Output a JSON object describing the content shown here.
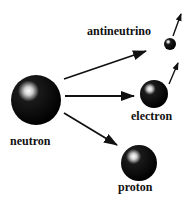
{
  "diagram": {
    "colors": {
      "particle": "#000000",
      "highlight": "#ffffff",
      "arrow": "#111111",
      "text": "#111111",
      "background": "#ffffff"
    },
    "particles": [
      {
        "id": "neutron",
        "label": "neutron",
        "cx": 36,
        "cy": 100,
        "r": 25
      },
      {
        "id": "electron",
        "label": "electron",
        "cx": 154,
        "cy": 94,
        "r": 14
      },
      {
        "id": "proton",
        "label": "proton",
        "cx": 139,
        "cy": 163,
        "r": 18
      },
      {
        "id": "antineutrino",
        "label": "antineutrino",
        "cx": 170,
        "cy": 44,
        "r": 6
      }
    ],
    "arrows": [
      {
        "from": "neutron",
        "to": "antineutrino",
        "x1": 64,
        "y1": 79,
        "x2": 146,
        "y2": 51
      },
      {
        "from": "neutron",
        "to": "electron",
        "x1": 65,
        "y1": 96,
        "x2": 134,
        "y2": 96
      },
      {
        "from": "neutron",
        "to": "proton",
        "x1": 64,
        "y1": 113,
        "x2": 117,
        "y2": 145
      },
      {
        "from": "antineutrino",
        "to": "motion",
        "x1": 173,
        "y1": 36,
        "x2": 181,
        "y2": 14
      },
      {
        "from": "electron",
        "to": "motion",
        "x1": 169,
        "y1": 84,
        "x2": 178,
        "y2": 63
      }
    ]
  },
  "labels": {
    "neutron": "neutron",
    "electron": "electron",
    "proton": "proton",
    "antineutrino": "antineutrino"
  }
}
